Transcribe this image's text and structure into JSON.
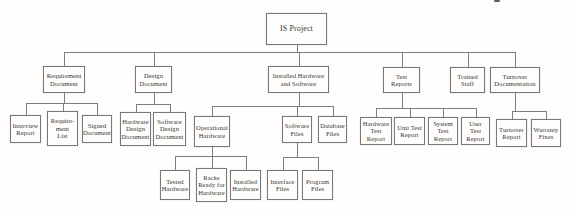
{
  "colors": {
    "background": "#fffefd",
    "box_fill": "#fefdfb",
    "box_border": "#787878",
    "connector": "#7d7d7d",
    "text": "#343434"
  },
  "artifact": {
    "x": 494,
    "y": 0,
    "w": 6,
    "h": 2
  },
  "nodes": [
    {
      "id": "is-project",
      "name": "wbs-box-is-project",
      "label": "IS Project",
      "parent": null,
      "level": 0,
      "x": 266,
      "y": 13,
      "w": 61,
      "h": 32,
      "fs": 8,
      "busY": 52
    },
    {
      "id": "requirement-document",
      "name": "wbs-box-requirement-document",
      "label": "Requirement\nDocument",
      "parent": "is-project",
      "level": 1,
      "x": 43,
      "y": 66,
      "w": 42,
      "h": 27,
      "busY": 103
    },
    {
      "id": "design-document",
      "name": "wbs-box-design-document",
      "label": "Design\nDocument",
      "parent": "is-project",
      "level": 1,
      "x": 135,
      "y": 66,
      "w": 37,
      "h": 27,
      "busY": 104
    },
    {
      "id": "installed-hardware-software",
      "name": "wbs-box-installed-hardware-and-software",
      "label": "Installed Hardware\nand Software",
      "parent": "is-project",
      "level": 1,
      "x": 268,
      "y": 66,
      "w": 61,
      "h": 27,
      "busY": 106
    },
    {
      "id": "test-reports",
      "name": "wbs-box-test-reports",
      "label": "Test\nReports",
      "parent": "is-project",
      "level": 1,
      "x": 383,
      "y": 67,
      "w": 37,
      "h": 26,
      "busY": 108
    },
    {
      "id": "trained-staff",
      "name": "wbs-box-trained-staff",
      "label": "Trained\nStaff",
      "parent": "is-project",
      "level": 1,
      "x": 450,
      "y": 67,
      "w": 35,
      "h": 26
    },
    {
      "id": "turnover-documentation",
      "name": "wbs-box-turnover-documentation",
      "label": "Turnover\nDocumentation",
      "parent": "is-project",
      "level": 1,
      "x": 490,
      "y": 67,
      "w": 50,
      "h": 26,
      "busY": 111
    },
    {
      "id": "interview-report",
      "name": "wbs-box-interview-report",
      "label": "Interview\nReport",
      "parent": "requirement-document",
      "level": 2,
      "x": 10,
      "y": 115,
      "w": 31,
      "h": 28
    },
    {
      "id": "requirement-list",
      "name": "wbs-box-requirement-list",
      "label": "Require-\nment\nList",
      "parent": "requirement-document",
      "level": 2,
      "x": 47,
      "y": 111,
      "w": 31,
      "h": 35
    },
    {
      "id": "signed-document",
      "name": "wbs-box-signed-document",
      "label": "Signed\nDocument",
      "parent": "requirement-document",
      "level": 2,
      "x": 82,
      "y": 115,
      "w": 30,
      "h": 28
    },
    {
      "id": "hardware-design-document",
      "name": "wbs-box-hardware-design-document",
      "label": "Hardware\nDesign\nDocument",
      "parent": "design-document",
      "level": 2,
      "x": 120,
      "y": 112,
      "w": 31,
      "h": 34
    },
    {
      "id": "software-design-document",
      "name": "wbs-box-software-design-document",
      "label": "Software\nDesign\nDocument",
      "parent": "design-document",
      "level": 2,
      "x": 153,
      "y": 112,
      "w": 33,
      "h": 34
    },
    {
      "id": "operational-hardware",
      "name": "wbs-box-operational-hardware",
      "label": "Operational\nHardware",
      "parent": "installed-hardware-software",
      "level": 2,
      "x": 194,
      "y": 116,
      "w": 36,
      "h": 31,
      "busY": 156
    },
    {
      "id": "software-files",
      "name": "wbs-box-software-files",
      "label": "Software\nFiles",
      "parent": "installed-hardware-software",
      "level": 2,
      "x": 282,
      "y": 116,
      "w": 30,
      "h": 27,
      "busY": 157
    },
    {
      "id": "database-files",
      "name": "wbs-box-database-files",
      "label": "Database\nFiles",
      "parent": "installed-hardware-software",
      "level": 2,
      "x": 318,
      "y": 116,
      "w": 29,
      "h": 27
    },
    {
      "id": "hardware-test-report",
      "name": "wbs-box-hardware-test-report",
      "label": "Hardware\nTest Report",
      "parent": "test-reports",
      "level": 2,
      "x": 360,
      "y": 117,
      "w": 32,
      "h": 28
    },
    {
      "id": "unit-test-report",
      "name": "wbs-box-unit-test-report",
      "label": "Unit Test\nReport",
      "parent": "test-reports",
      "level": 2,
      "x": 394,
      "y": 117,
      "w": 31,
      "h": 28
    },
    {
      "id": "system-test-report",
      "name": "wbs-box-system-test-report",
      "label": "System\nTest Report",
      "parent": "test-reports",
      "level": 2,
      "x": 428,
      "y": 117,
      "w": 30,
      "h": 28
    },
    {
      "id": "user-test-report",
      "name": "wbs-box-user-test-report",
      "label": "User Test\nReport",
      "parent": "test-reports",
      "level": 2,
      "x": 461,
      "y": 117,
      "w": 29,
      "h": 28
    },
    {
      "id": "turnover-report",
      "name": "wbs-box-turnover-report",
      "label": "Turnover\nReport",
      "parent": "turnover-documentation",
      "level": 2,
      "x": 496,
      "y": 119,
      "w": 31,
      "h": 28
    },
    {
      "id": "warranty-fixes",
      "name": "wbs-box-warranty-fixes",
      "label": "Warranty\nFixes",
      "parent": "turnover-documentation",
      "level": 2,
      "x": 531,
      "y": 119,
      "w": 30,
      "h": 28
    },
    {
      "id": "tested-hardware",
      "name": "wbs-box-tested-hardware",
      "label": "Tested\nHardware",
      "parent": "operational-hardware",
      "level": 3,
      "x": 160,
      "y": 170,
      "w": 30,
      "h": 30
    },
    {
      "id": "racks-ready-for-hardware",
      "name": "wbs-box-racks-ready-for-hardware",
      "label": "Racks\nReady for\nHardware",
      "parent": "operational-hardware",
      "level": 3,
      "x": 196,
      "y": 168,
      "w": 31,
      "h": 34
    },
    {
      "id": "installed-hardware",
      "name": "wbs-box-installed-hardware",
      "label": "Installed\nHardware",
      "parent": "operational-hardware",
      "level": 3,
      "x": 230,
      "y": 170,
      "w": 31,
      "h": 30
    },
    {
      "id": "interface-files",
      "name": "wbs-box-interface-files",
      "label": "Interface\nFiles",
      "parent": "software-files",
      "level": 3,
      "x": 267,
      "y": 170,
      "w": 31,
      "h": 30
    },
    {
      "id": "program-files",
      "name": "wbs-box-program-files",
      "label": "Program\nFiles",
      "parent": "software-files",
      "level": 3,
      "x": 302,
      "y": 170,
      "w": 31,
      "h": 30
    }
  ]
}
